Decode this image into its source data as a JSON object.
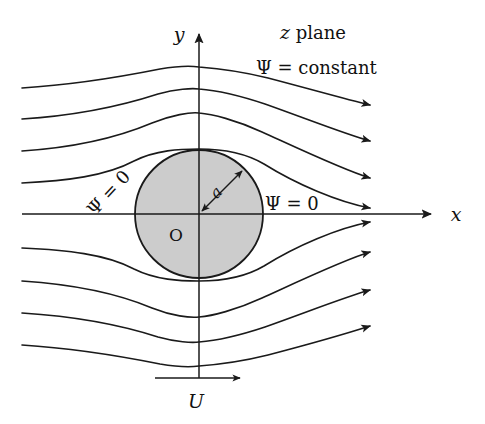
{
  "figure": {
    "title_label": "z plane",
    "background_color": "#ffffff",
    "ink_color": "#1a1a1a",
    "cylinder_fill_color": "#cccccc"
  },
  "axes": {
    "x_label": "x",
    "y_label": "y",
    "origin_label": "O",
    "x_axis": {
      "x1": 22,
      "y1": 214,
      "x2": 437,
      "y2": 214
    },
    "y_axis": {
      "x1": 199,
      "y1": 378,
      "x2": 199,
      "y2": 26
    },
    "x_label_pos": {
      "x": 456,
      "y": 221
    },
    "y_label_pos": {
      "x": 179,
      "y": 41
    },
    "origin_label_pos": {
      "x": 176,
      "y": 240
    }
  },
  "cylinder": {
    "center": {
      "x": 199,
      "y": 214
    },
    "radius": 64,
    "radius_symbol": "a",
    "radius_arrow": {
      "from_x": 199,
      "from_y": 214,
      "to_x": 244,
      "to_y": 169
    },
    "radius_label_pos": {
      "x": 218,
      "y": 196
    },
    "radius_label_rotation": -45
  },
  "labels": [
    {
      "name": "z-plane-label",
      "text": "z plane",
      "x": 313,
      "y": 38,
      "style": "mixed-italic-roman",
      "italic_part": "z",
      "roman_part": " plane"
    },
    {
      "name": "psi-constant-label",
      "text": "Ψ = constant",
      "x": 256,
      "y": 73,
      "style": "italic-psi"
    },
    {
      "name": "psi-zero-right-label",
      "text": "Ψ = 0",
      "x": 265,
      "y": 209,
      "style": "italic-psi"
    },
    {
      "name": "psi-zero-left-label",
      "text": "Ψ = 0",
      "x": 113,
      "y": 197,
      "style": "italic-psi",
      "rotation": -47
    }
  ],
  "freestream": {
    "symbol": "U",
    "label_pos": {
      "x": 194,
      "y": 407
    },
    "arrow": {
      "x1": 155,
      "y1": 378,
      "x2": 246,
      "y2": 378
    }
  },
  "chart_data": {
    "type": "line",
    "xlabel": "x",
    "ylabel": "y",
    "grid": false,
    "legend": null,
    "annotations": [
      "z plane",
      "Ψ = constant",
      "Ψ = 0",
      "Ψ = 0",
      "a",
      "O",
      "U"
    ],
    "obstacle": {
      "shape": "circle",
      "center_x": 0,
      "center_y": 0,
      "radius": 1,
      "radius_label": "a",
      "fill": "#cccccc"
    },
    "flow_direction": "left-to-right",
    "freestream_speed_label": "U",
    "streamfunction": "Psi = U*y*(1 - a^2/(x^2+y^2))",
    "series": [
      {
        "name": "streamline-upper-4",
        "psi_level": 4,
        "y_far_upstream": 88,
        "y_far_downstream": 104,
        "arrowhead": true,
        "points": [
          [
            22,
            88
          ],
          [
            60,
            84
          ],
          [
            100,
            79
          ],
          [
            140,
            72
          ],
          [
            180,
            68
          ],
          [
            199,
            67
          ],
          [
            220,
            68
          ],
          [
            260,
            73
          ],
          [
            300,
            83
          ],
          [
            340,
            94
          ],
          [
            376,
            104
          ]
        ]
      },
      {
        "name": "streamline-upper-3",
        "psi_level": 3,
        "y_far_upstream": 119,
        "y_far_downstream": 140,
        "arrowhead": true,
        "points": [
          [
            22,
            119
          ],
          [
            60,
            115
          ],
          [
            100,
            108
          ],
          [
            140,
            98
          ],
          [
            180,
            91
          ],
          [
            199,
            90
          ],
          [
            220,
            91
          ],
          [
            260,
            98
          ],
          [
            300,
            112
          ],
          [
            340,
            129
          ],
          [
            376,
            140
          ]
        ]
      },
      {
        "name": "streamline-upper-2",
        "psi_level": 2,
        "y_far_upstream": 151,
        "y_far_downstream": 177,
        "arrowhead": true,
        "points": [
          [
            22,
            151
          ],
          [
            60,
            147
          ],
          [
            100,
            139
          ],
          [
            140,
            126
          ],
          [
            180,
            116
          ],
          [
            199,
            114
          ],
          [
            220,
            116
          ],
          [
            260,
            126
          ],
          [
            300,
            145
          ],
          [
            340,
            166
          ],
          [
            376,
            177
          ]
        ]
      },
      {
        "name": "streamline-upper-1",
        "psi_level": 1,
        "y_far_upstream": 183,
        "y_far_downstream": 207,
        "arrowhead": true,
        "points": [
          [
            22,
            183
          ],
          [
            60,
            180
          ],
          [
            100,
            172
          ],
          [
            136,
            159
          ],
          [
            160,
            152
          ],
          [
            180,
            150
          ],
          [
            199,
            150
          ],
          [
            220,
            152
          ],
          [
            245,
            159
          ],
          [
            268,
            170
          ],
          [
            300,
            186
          ],
          [
            340,
            200
          ],
          [
            376,
            207
          ]
        ]
      },
      {
        "name": "streamline-axis",
        "psi_level": 0,
        "y_far_upstream": 214,
        "y_far_downstream": 214,
        "arrowhead": true,
        "note": "dividing streamline coincides with the x axis",
        "points": [
          [
            22,
            214
          ],
          [
            199,
            214
          ],
          [
            437,
            214
          ]
        ]
      },
      {
        "name": "streamline-lower-1",
        "psi_level": -1,
        "y_far_upstream": 248,
        "y_far_downstream": 222,
        "arrowhead": true,
        "points": [
          [
            22,
            248
          ],
          [
            60,
            250
          ],
          [
            100,
            258
          ],
          [
            136,
            270
          ],
          [
            160,
            277
          ],
          [
            180,
            279
          ],
          [
            199,
            279
          ],
          [
            220,
            277
          ],
          [
            245,
            270
          ],
          [
            268,
            259
          ],
          [
            300,
            242
          ],
          [
            340,
            229
          ],
          [
            376,
            222
          ]
        ]
      },
      {
        "name": "streamline-lower-2",
        "psi_level": -2,
        "y_far_upstream": 281,
        "y_far_downstream": 252,
        "arrowhead": true,
        "points": [
          [
            22,
            281
          ],
          [
            60,
            284
          ],
          [
            100,
            292
          ],
          [
            140,
            304
          ],
          [
            180,
            313
          ],
          [
            199,
            315
          ],
          [
            220,
            313
          ],
          [
            260,
            304
          ],
          [
            300,
            285
          ],
          [
            340,
            263
          ],
          [
            376,
            252
          ]
        ]
      },
      {
        "name": "streamline-lower-3",
        "psi_level": -3,
        "y_far_upstream": 313,
        "y_far_downstream": 289,
        "arrowhead": true,
        "points": [
          [
            22,
            313
          ],
          [
            60,
            316
          ],
          [
            100,
            322
          ],
          [
            140,
            331
          ],
          [
            180,
            338
          ],
          [
            199,
            339
          ],
          [
            220,
            338
          ],
          [
            260,
            331
          ],
          [
            300,
            317
          ],
          [
            340,
            299
          ],
          [
            376,
            289
          ]
        ]
      },
      {
        "name": "streamline-lower-4",
        "psi_level": -4,
        "y_far_upstream": 345,
        "y_far_downstream": 325,
        "arrowhead": true,
        "points": [
          [
            22,
            345
          ],
          [
            60,
            347
          ],
          [
            100,
            351
          ],
          [
            140,
            358
          ],
          [
            180,
            363
          ],
          [
            199,
            364
          ],
          [
            220,
            363
          ],
          [
            260,
            357
          ],
          [
            300,
            346
          ],
          [
            340,
            333
          ],
          [
            376,
            325
          ]
        ]
      }
    ]
  }
}
